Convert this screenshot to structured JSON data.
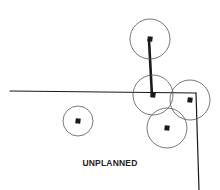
{
  "diagram": {
    "caption": "UNPLANNED",
    "colors": {
      "ink": "#1a1a1a",
      "circle": "#555555",
      "background": "#ffffff"
    },
    "lines": [
      {
        "name": "horizontal-road",
        "x1": 10,
        "y1": 91,
        "x2": 196,
        "y2": 93,
        "width": 1.2
      },
      {
        "name": "vertical-road",
        "x1": 196,
        "y1": 93,
        "x2": 199,
        "y2": 190,
        "width": 1.2
      },
      {
        "name": "thick-connector",
        "x1": 149,
        "y1": 40,
        "x2": 152,
        "y2": 96,
        "width": 2.6
      }
    ],
    "nodes": [
      {
        "name": "node-top",
        "cx": 150,
        "cy": 39,
        "r": 20
      },
      {
        "name": "node-center",
        "cx": 153,
        "cy": 95,
        "r": 20
      },
      {
        "name": "node-right",
        "cx": 190,
        "cy": 100,
        "r": 20
      },
      {
        "name": "node-bottom",
        "cx": 167,
        "cy": 128,
        "r": 20
      },
      {
        "name": "node-isolated",
        "cx": 78,
        "cy": 121,
        "r": 15
      }
    ]
  }
}
